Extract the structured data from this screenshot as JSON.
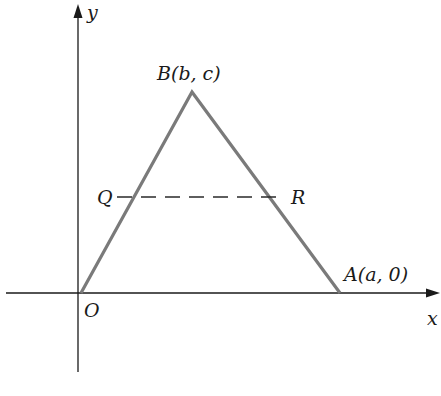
{
  "diagram": {
    "type": "coordinate-geometry",
    "axes": {
      "x_label": "x",
      "y_label": "y",
      "origin_label": "O"
    },
    "triangle": {
      "vertices": [
        {
          "name": "O",
          "label": "O"
        },
        {
          "name": "A",
          "label": "A(a, 0)"
        },
        {
          "name": "B",
          "label": "B(b, c)"
        }
      ],
      "stroke_color": "#7a7a7a"
    },
    "midsegment": {
      "start_label": "Q",
      "end_label": "R",
      "style": "dashed"
    },
    "colors": {
      "axis": "#1a1a1a",
      "triangle": "#7a7a7a",
      "background": "#ffffff"
    }
  }
}
